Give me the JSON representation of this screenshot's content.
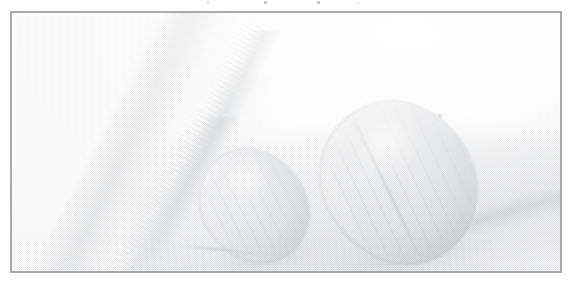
{
  "document": {
    "type": "scanned-photograph-figure",
    "page_background": "#ffffff",
    "caption_above": "",
    "caption_below": ""
  },
  "frame": {
    "name": "figure-frame",
    "border_color": "#a9aaac",
    "border_width_px": 2,
    "x": 10,
    "y": 11,
    "width": 552,
    "height": 262,
    "fill": "#ffffff"
  },
  "photo": {
    "title": "",
    "description": "Very faded, washed-out grayscale scan of two ovoid nut-like objects resting beside a long diagonal cylindrical wedge, with soft diagonal ground shadows.",
    "overall_tone": "near-white, extremely low contrast",
    "texture": "fine halftone dither screen",
    "darkest_value": "#b0b2b6",
    "lightest_value": "#ffffff",
    "subjects": [
      {
        "name": "large-ovoid",
        "label": "large ovoid object",
        "position": "right of center",
        "center_x": 387,
        "center_y": 170,
        "width": 150,
        "height": 168,
        "rotation_deg": -31,
        "fill": "#cecfd2",
        "features": [
          "longitudinal ribs",
          "central seam",
          "dark dimple at upper right",
          "soft highlight on upper-left shoulder"
        ]
      },
      {
        "name": "small-ovoid",
        "label": "small ovoid object",
        "position": "left of center",
        "center_x": 242,
        "center_y": 193,
        "width": 104,
        "height": 120,
        "rotation_deg": -36,
        "fill": "#d6d7da",
        "features": [
          "longitudinal ribs",
          "soft highlight upper-left",
          "contact shadow below"
        ]
      },
      {
        "name": "diagonal-wedge",
        "label": "diagonal cylindrical wedge",
        "position": "upper-left running to lower-center",
        "angle_deg": 118,
        "fill": "#d6d7d9",
        "features": [
          "two converging straight edges",
          "fine comb striations along edges",
          "tapers to a point near bottom center"
        ]
      },
      {
        "name": "ground-shadow",
        "label": "diagonal ground shadow",
        "position": "lower right",
        "fill": "#d1d2d5",
        "features": [
          "soft blurred diagonal bands"
        ]
      }
    ],
    "marks_above_frame": [
      {
        "name": "speck",
        "x": 264,
        "y": 1
      },
      {
        "name": "speck",
        "x": 317,
        "y": 1
      },
      {
        "name": "speck",
        "x": 207,
        "y": 2
      },
      {
        "name": "speck",
        "x": 357,
        "y": 2
      }
    ]
  },
  "colors": {
    "frame_border": "#a9aaac",
    "page": "#ffffff",
    "mid_gray": "#c9cacd",
    "shadow_gray": "#b0b2b6",
    "highlight": "#ffffff"
  }
}
